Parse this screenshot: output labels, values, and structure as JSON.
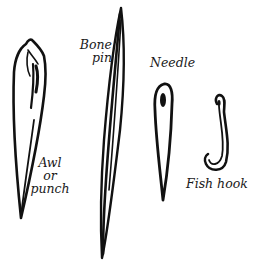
{
  "figure": {
    "ink_color": "#111111",
    "background": "#ffffff",
    "items": [
      {
        "id": "awl",
        "label_lines": [
          "Awl",
          "or",
          "punch"
        ]
      },
      {
        "id": "bone-pin",
        "label_lines": [
          "Bone",
          "pin"
        ]
      },
      {
        "id": "needle",
        "label_lines": [
          "Needle"
        ]
      },
      {
        "id": "fish-hook",
        "label_lines": [
          "Fish hook"
        ]
      }
    ]
  }
}
